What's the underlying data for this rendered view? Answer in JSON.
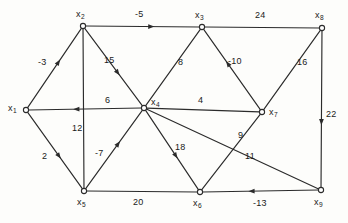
{
  "figure": {
    "type": "directed-weighted-graph",
    "background_color": "#fdfdfb",
    "ink_color": "#2b2b2b"
  },
  "nodes": [
    {
      "id": "x1",
      "label": "x",
      "subscript": "1",
      "x": 26,
      "y": 110,
      "label_x": 8,
      "label_y": 104
    },
    {
      "id": "x2",
      "label": "x",
      "subscript": "2",
      "x": 83,
      "y": 26,
      "label_x": 76,
      "label_y": 10
    },
    {
      "id": "x3",
      "label": "x",
      "subscript": "3",
      "x": 202,
      "y": 27,
      "label_x": 195,
      "label_y": 11
    },
    {
      "id": "x4",
      "label": "x",
      "subscript": "4",
      "x": 144,
      "y": 108,
      "label_x": 151,
      "label_y": 98
    },
    {
      "id": "x5",
      "label": "x",
      "subscript": "5",
      "x": 84,
      "y": 191,
      "label_x": 77,
      "label_y": 198
    },
    {
      "id": "x6",
      "label": "x",
      "subscript": "6",
      "x": 200,
      "y": 192,
      "label_x": 193,
      "label_y": 199
    },
    {
      "id": "x7",
      "label": "x",
      "subscript": "7",
      "x": 262,
      "y": 112,
      "label_x": 269,
      "label_y": 108
    },
    {
      "id": "x8",
      "label": "x",
      "subscript": "8",
      "x": 322,
      "y": 28,
      "label_x": 315,
      "label_y": 11
    },
    {
      "id": "x9",
      "label": "x",
      "subscript": "9",
      "x": 321,
      "y": 190,
      "label_x": 314,
      "label_y": 198
    }
  ],
  "edges": [
    {
      "id": "e1",
      "from": "x1",
      "to": "x2",
      "weight": "-3",
      "directed": true,
      "label_x": 38,
      "label_y": 58
    },
    {
      "id": "e2",
      "from": "x1",
      "to": "x5",
      "weight": "2",
      "directed": true,
      "label_x": 42,
      "label_y": 152
    },
    {
      "id": "e3",
      "from": "x2",
      "to": "x3",
      "weight": "-5",
      "directed": true,
      "label_x": 135,
      "label_y": 10
    },
    {
      "id": "e4",
      "from": "x2",
      "to": "x4",
      "weight": "15",
      "directed": true,
      "label_x": 104,
      "label_y": 56
    },
    {
      "id": "e5",
      "from": "x2",
      "to": "x5",
      "weight": "12",
      "directed": false,
      "label_x": 72,
      "label_y": 124
    },
    {
      "id": "e6",
      "from": "x4",
      "to": "x1",
      "weight": "6",
      "directed": true,
      "label_x": 105,
      "label_y": 96
    },
    {
      "id": "e7",
      "from": "x4",
      "to": "x3",
      "weight": "8",
      "directed": false,
      "label_x": 178,
      "label_y": 58
    },
    {
      "id": "e8",
      "from": "x7",
      "to": "x3",
      "weight": "-10",
      "directed": true,
      "label_x": 228,
      "label_y": 57
    },
    {
      "id": "e9",
      "from": "x3",
      "to": "x8",
      "weight": "24",
      "directed": false,
      "label_x": 255,
      "label_y": 11
    },
    {
      "id": "e10",
      "from": "x7",
      "to": "x4",
      "weight": "4",
      "directed": false,
      "label_x": 198,
      "label_y": 96
    },
    {
      "id": "e11",
      "from": "x7",
      "to": "x8",
      "weight": "16",
      "directed": false,
      "label_x": 297,
      "label_y": 58
    },
    {
      "id": "e12",
      "from": "x8",
      "to": "x9",
      "weight": "22",
      "directed": true,
      "label_x": 326,
      "label_y": 110
    },
    {
      "id": "e13",
      "from": "x5",
      "to": "x4",
      "weight": "-7",
      "directed": true,
      "label_x": 95,
      "label_y": 149
    },
    {
      "id": "e14",
      "from": "x4",
      "to": "x6",
      "weight": "18",
      "directed": true,
      "label_x": 175,
      "label_y": 143
    },
    {
      "id": "e15",
      "from": "x4",
      "to": "x9",
      "weight": "11",
      "directed": false,
      "label_x": 245,
      "label_y": 152
    },
    {
      "id": "e16",
      "from": "x6",
      "to": "x7",
      "weight": "9",
      "directed": false,
      "label_x": 238,
      "label_y": 131
    },
    {
      "id": "e17",
      "from": "x5",
      "to": "x6",
      "weight": "20",
      "directed": false,
      "label_x": 133,
      "label_y": 198
    },
    {
      "id": "e18",
      "from": "x9",
      "to": "x6",
      "weight": "-13",
      "directed": true,
      "label_x": 253,
      "label_y": 199
    }
  ],
  "chart_data": {
    "type": "diagram",
    "title": "",
    "nodes": [
      "x1",
      "x2",
      "x3",
      "x4",
      "x5",
      "x6",
      "x7",
      "x8",
      "x9"
    ],
    "weighted_edges": [
      {
        "from": "x1",
        "to": "x2",
        "weight": -3
      },
      {
        "from": "x1",
        "to": "x5",
        "weight": 2
      },
      {
        "from": "x2",
        "to": "x3",
        "weight": -5
      },
      {
        "from": "x2",
        "to": "x4",
        "weight": 15
      },
      {
        "from": "x2",
        "to": "x5",
        "weight": 12
      },
      {
        "from": "x4",
        "to": "x1",
        "weight": 6
      },
      {
        "from": "x4",
        "to": "x3",
        "weight": 8
      },
      {
        "from": "x7",
        "to": "x3",
        "weight": -10
      },
      {
        "from": "x3",
        "to": "x8",
        "weight": 24
      },
      {
        "from": "x7",
        "to": "x4",
        "weight": 4
      },
      {
        "from": "x7",
        "to": "x8",
        "weight": 16
      },
      {
        "from": "x8",
        "to": "x9",
        "weight": 22
      },
      {
        "from": "x5",
        "to": "x4",
        "weight": -7
      },
      {
        "from": "x4",
        "to": "x6",
        "weight": 18
      },
      {
        "from": "x4",
        "to": "x9",
        "weight": 11
      },
      {
        "from": "x6",
        "to": "x7",
        "weight": 9
      },
      {
        "from": "x5",
        "to": "x6",
        "weight": 20
      },
      {
        "from": "x9",
        "to": "x6",
        "weight": -13
      }
    ]
  }
}
